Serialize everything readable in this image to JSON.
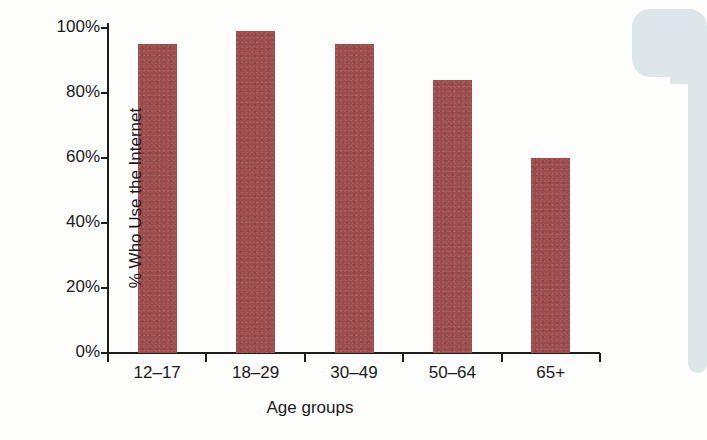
{
  "chart_data": {
    "type": "bar",
    "title": "",
    "subtitle": "",
    "xlabel": "Age groups",
    "ylabel": "% Who Use the Internet",
    "categories": [
      "12–17",
      "18–29",
      "30–49",
      "50–64",
      "65+"
    ],
    "values": [
      95,
      99,
      95,
      84,
      60
    ],
    "ylim": [
      0,
      100
    ],
    "yticks": [
      0,
      20,
      40,
      60,
      80,
      100
    ],
    "ytick_labels": [
      "0%",
      "20%",
      "40%",
      "60%",
      "80%",
      "100%"
    ],
    "grid": false,
    "legend": null,
    "series": [
      {
        "name": "% Who Use the Internet",
        "values": [
          95,
          99,
          95,
          84,
          60
        ]
      }
    ],
    "bar_color": "#9c4c4c",
    "axis_color": "#1d1d1d",
    "background_color": "#fdfdfc"
  },
  "decoration": {
    "color": "#dde6e9",
    "name": "page-edge-artifact"
  }
}
